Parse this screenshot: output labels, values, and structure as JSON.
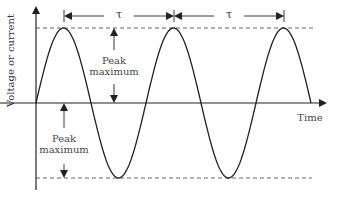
{
  "diagram": {
    "y_axis_label": "Voltage or current",
    "x_axis_label": "Time",
    "period_symbol": "τ",
    "period_labels": [
      "τ",
      "τ"
    ],
    "peak_labels": [
      {
        "line1": "Peak",
        "line2": "maximum",
        "position": "upper"
      },
      {
        "line1": "Peak",
        "line2": "maximum",
        "position": "lower"
      }
    ],
    "colors": {
      "line": "#222222",
      "dashed": "#555555",
      "text": "#4a4a4a"
    },
    "waveform": {
      "type": "sine",
      "cycles": 2.5,
      "peaks_count": 3,
      "troughs_count": 2
    }
  }
}
